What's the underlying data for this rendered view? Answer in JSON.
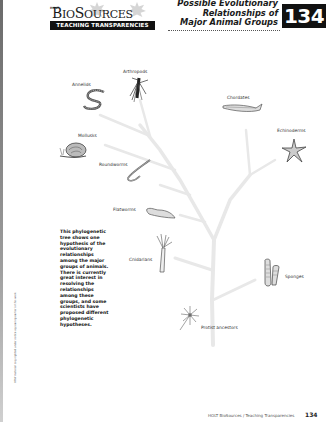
{
  "header": {
    "publisher_small": "HOLT",
    "logo_word_big1": "B",
    "logo_word_small1": "IO",
    "logo_word_big2": "S",
    "logo_word_small2": "OURCES",
    "logo_bar": "TEACHING TRANSPARENCIES",
    "title_line1": "Possible Evolutionary",
    "title_line2": "Relationships of",
    "title_line3": "Major Animal Groups",
    "transparency_number": "134"
  },
  "tree": {
    "title": "Phylogenetic tree of major animal groups",
    "labels": {
      "annelids": "Annelids",
      "arthropods": "Arthropods",
      "chordates": "Chordates",
      "echinoderms": "Echinoderms",
      "mollusks": "Mollusks",
      "roundworms": "Roundworms",
      "flatworms": "Flatworms",
      "cnidarians": "Cnidarians",
      "sponges": "Sponges",
      "protist_ancestors": "Protist ancestors"
    },
    "branch_color": "#e6e6e6"
  },
  "description": "This phylogenetic tree shows one hypothesis of the evolutionary relationships among the major groups of animals. There is currently great interest in resolving the relationships among these groups, and some scientists have proposed different phylogenetic hypotheses.",
  "side_note": "HRW material copyrighted under notice appearing earlier in this work.",
  "footer": {
    "text": "HOLT BioSources / Teaching Transparencies",
    "page": "134"
  }
}
